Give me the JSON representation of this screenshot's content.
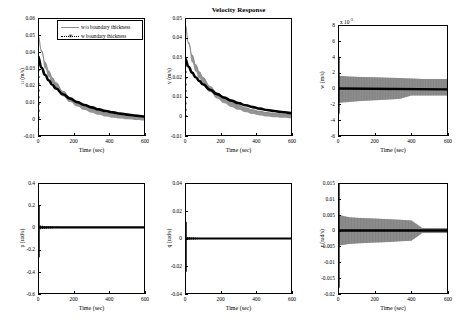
{
  "figure": {
    "title": "Velocity Response",
    "xlabel": "Time (sec)",
    "legend": {
      "items": [
        {
          "label": "w/o boundary thickness",
          "style": "solid-gray"
        },
        {
          "label": "w boundary thickness",
          "style": "dotted-black-star"
        }
      ]
    }
  },
  "chart_data": [
    {
      "type": "line",
      "name": "u-velocity",
      "title": "",
      "xlabel": "Time (sec)",
      "ylabel": "u (m/s)",
      "xlim": [
        0,
        600
      ],
      "ylim": [
        -0.01,
        0.06
      ],
      "xticks": [
        0,
        200,
        400,
        600
      ],
      "xticklabels": [
        "0",
        "200",
        "400",
        "600"
      ],
      "yticks": [
        -0.01,
        0,
        0.01,
        0.02,
        0.03,
        0.04,
        0.05,
        0.06
      ],
      "yticklabels": [
        "-0.01",
        "0",
        "0.01",
        "0.02",
        "0.03",
        "0.04",
        "0.05",
        "0.06"
      ],
      "grid": false,
      "series": [
        {
          "name": "w/o boundary thickness",
          "color": "#8c8c8c",
          "x": [
            0,
            20,
            40,
            60,
            80,
            100,
            140,
            180,
            220,
            260,
            300,
            340,
            380,
            420,
            460,
            500,
            540,
            600
          ],
          "values": [
            0.05,
            0.0405,
            0.0335,
            0.0285,
            0.0245,
            0.0215,
            0.0165,
            0.0128,
            0.01,
            0.0078,
            0.0061,
            0.0048,
            0.0037,
            0.0029,
            0.0023,
            0.0018,
            0.0014,
            0.001
          ],
          "band": true
        },
        {
          "name": "w boundary thickness",
          "color": "#000000",
          "x": [
            0,
            20,
            40,
            60,
            80,
            100,
            140,
            180,
            220,
            260,
            300,
            340,
            380,
            420,
            460,
            500,
            540,
            600
          ],
          "values": [
            0.037,
            0.0305,
            0.0262,
            0.023,
            0.0204,
            0.0182,
            0.0148,
            0.0122,
            0.0101,
            0.0084,
            0.007,
            0.0058,
            0.0048,
            0.004,
            0.0033,
            0.0027,
            0.0022,
            0.0016
          ]
        }
      ],
      "initial_markers": {
        "x": 0,
        "values": [
          0.037,
          0.033,
          0.029,
          0.025,
          0.021,
          0.017,
          0.013,
          0.009,
          0.005,
          0.001
        ]
      }
    },
    {
      "type": "line",
      "name": "v-velocity",
      "title": "Velocity Response",
      "xlabel": "Time (sec)",
      "ylabel": "v (m/s)",
      "xlim": [
        0,
        600
      ],
      "ylim": [
        -0.01,
        0.05
      ],
      "xticks": [
        0,
        200,
        400,
        600
      ],
      "xticklabels": [
        "0",
        "200",
        "400",
        "600"
      ],
      "yticks": [
        -0.01,
        0,
        0.01,
        0.02,
        0.03,
        0.04,
        0.05
      ],
      "yticklabels": [
        "-0.01",
        "0",
        "0.01",
        "0.02",
        "0.03",
        "0.04",
        "0.05"
      ],
      "grid": false,
      "series": [
        {
          "name": "w/o boundary thickness",
          "color": "#8c8c8c",
          "x": [
            0,
            20,
            40,
            60,
            80,
            100,
            140,
            180,
            220,
            260,
            300,
            340,
            380,
            420,
            460,
            500,
            540,
            600
          ],
          "values": [
            0.047,
            0.0375,
            0.031,
            0.0262,
            0.0226,
            0.0197,
            0.0152,
            0.0118,
            0.0092,
            0.0072,
            0.0056,
            0.0043,
            0.0033,
            0.0025,
            0.0019,
            0.0014,
            0.0011,
            0.0008
          ],
          "band": true
        },
        {
          "name": "w boundary thickness",
          "color": "#000000",
          "x": [
            0,
            20,
            40,
            60,
            80,
            100,
            140,
            180,
            220,
            260,
            300,
            340,
            380,
            420,
            460,
            500,
            540,
            600
          ],
          "values": [
            0.0295,
            0.0252,
            0.0222,
            0.0199,
            0.018,
            0.0163,
            0.0135,
            0.0113,
            0.0095,
            0.008,
            0.0067,
            0.0056,
            0.0047,
            0.0039,
            0.0032,
            0.0027,
            0.0022,
            0.0016
          ]
        }
      ],
      "initial_markers": {
        "x": 0,
        "values": [
          0.029,
          0.0258,
          0.0226,
          0.0194,
          0.0162,
          0.013,
          0.0098,
          0.0066,
          0.0034,
          0.0002
        ]
      }
    },
    {
      "type": "line",
      "name": "w-velocity",
      "title": "",
      "xlabel": "Time (sec)",
      "ylabel": "w (m/s)",
      "y_multiplier": "x 10^-3",
      "xlim": [
        0,
        600
      ],
      "ylim": [
        -6,
        8
      ],
      "xticks": [
        0,
        200,
        400,
        600
      ],
      "xticklabels": [
        "0",
        "200",
        "400",
        "600"
      ],
      "yticks": [
        -6,
        -4,
        -2,
        0,
        2,
        4,
        6,
        8
      ],
      "yticklabels": [
        "-6",
        "-4",
        "-2",
        "0",
        "2",
        "4",
        "6",
        "8"
      ],
      "grid": false,
      "description": "oscillatory band about zero; initial spike from +4 to -3.2e-3, gray envelope approx +/-1.5e-3 narrowing after t=400",
      "series": [
        {
          "name": "w/o boundary thickness",
          "color": "#8c8c8c",
          "envelope_upper": [
            1.6,
            1.5,
            1.45,
            1.4,
            1.35,
            1.3,
            1.25,
            1.2,
            1.2,
            1.2
          ],
          "envelope_lower": [
            -1.8,
            -1.7,
            -1.6,
            -1.5,
            -1.4,
            -1.3,
            -0.9,
            -0.9,
            -0.9,
            -0.9
          ],
          "x": [
            0,
            60,
            120,
            200,
            280,
            340,
            400,
            460,
            520,
            600
          ]
        },
        {
          "name": "w boundary thickness",
          "color": "#000000",
          "x": [
            0,
            60,
            120,
            200,
            280,
            340,
            400,
            460,
            520,
            600
          ],
          "values": [
            -3.2,
            -0.2,
            -0.15,
            -0.12,
            -0.1,
            -0.1,
            -0.1,
            -0.1,
            -0.1,
            -0.1
          ]
        }
      ]
    },
    {
      "type": "line",
      "name": "p-rate",
      "title": "",
      "xlabel": "Time (sec)",
      "ylabel": "p (rad/s)",
      "xlim": [
        0,
        600
      ],
      "ylim": [
        -0.6,
        0.4
      ],
      "xticks": [
        0,
        200,
        400,
        600
      ],
      "xticklabels": [
        "0",
        "200",
        "400",
        "600"
      ],
      "yticks": [
        -0.6,
        -0.4,
        -0.2,
        0,
        0.2,
        0.4
      ],
      "yticklabels": [
        "-0.6",
        "-0.4",
        "-0.2",
        "0",
        "0.2",
        "0.4"
      ],
      "grid": false,
      "description": "sharp initial transient spike from +0.2 to -0.27 at t=0, decays to flat zero line",
      "series": [
        {
          "name": "w boundary thickness",
          "color": "#000000",
          "x": [
            0,
            5,
            10,
            20,
            40,
            80,
            200,
            400,
            600
          ],
          "values": [
            0.2,
            -0.27,
            0.03,
            -0.01,
            0.005,
            0.002,
            0.001,
            0.0005,
            0.0
          ]
        }
      ]
    },
    {
      "type": "line",
      "name": "q-rate",
      "title": "",
      "xlabel": "Time (sec)",
      "ylabel": "q (rad/s)",
      "xlim": [
        0,
        600
      ],
      "ylim": [
        -0.04,
        0.04
      ],
      "xticks": [
        0,
        200,
        400,
        600
      ],
      "xticklabels": [
        "0",
        "200",
        "400",
        "600"
      ],
      "yticks": [
        -0.04,
        -0.02,
        0,
        0.02,
        0.04
      ],
      "yticklabels": [
        "-0.04",
        "-0.02",
        "0",
        "0.02",
        "0.04"
      ],
      "grid": false,
      "description": "initial spike from +0.012 to -0.024 at t=0, then flat zero line",
      "series": [
        {
          "name": "w boundary thickness",
          "color": "#000000",
          "x": [
            0,
            5,
            10,
            20,
            40,
            80,
            200,
            400,
            600
          ],
          "values": [
            0.012,
            -0.024,
            0.003,
            -0.001,
            0.0005,
            0.0002,
            0.0001,
            5e-05,
            0.0
          ]
        }
      ]
    },
    {
      "type": "line",
      "name": "r-rate",
      "title": "",
      "xlabel": "Time (sec)",
      "ylabel": "r (rad/s)",
      "xlim": [
        0,
        600
      ],
      "ylim": [
        -0.02,
        0.015
      ],
      "xticks": [
        0,
        200,
        400,
        600
      ],
      "xticklabels": [
        "0",
        "200",
        "400",
        "600"
      ],
      "yticks": [
        -0.02,
        -0.015,
        -0.01,
        -0.005,
        0,
        0.005,
        0.01,
        0.015
      ],
      "yticklabels": [
        "-0.02",
        "-0.015",
        "-0.01",
        "-0.005",
        "0",
        "0.005",
        "0.01",
        "0.015"
      ],
      "grid": false,
      "description": "initial spike from +0.015 to -0.018; gray oscillatory band approx +/-0.004 narrowing sharply after t=400",
      "series": [
        {
          "name": "w/o boundary thickness",
          "color": "#8c8c8c",
          "x": [
            0,
            60,
            120,
            200,
            280,
            340,
            400,
            460,
            520,
            600
          ],
          "envelope_upper": [
            0.005,
            0.0042,
            0.004,
            0.0038,
            0.0036,
            0.0034,
            0.0032,
            0.0008,
            0.0008,
            0.0008
          ],
          "envelope_lower": [
            -0.0048,
            -0.0042,
            -0.004,
            -0.0038,
            -0.0036,
            -0.0034,
            -0.0032,
            -0.0008,
            -0.0008,
            -0.0008
          ]
        },
        {
          "name": "w boundary thickness",
          "color": "#000000",
          "x": [
            0,
            5,
            10,
            20,
            60,
            200,
            400,
            600
          ],
          "values": [
            0.015,
            -0.018,
            0.001,
            -0.0004,
            0.0,
            0.0,
            0.0,
            0.0
          ]
        }
      ]
    }
  ]
}
